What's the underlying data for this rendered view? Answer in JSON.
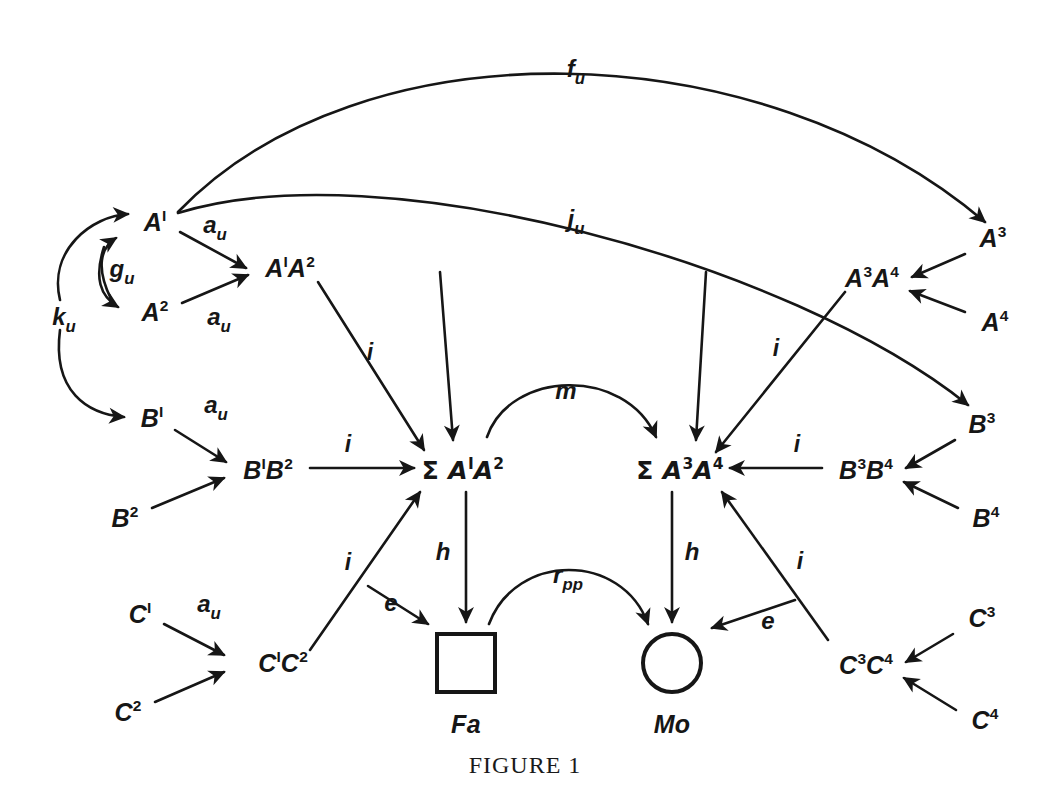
{
  "figure": {
    "caption": "FIGURE 1",
    "caption_top": 752,
    "background_color": "#ffffff",
    "ink_color": "#161616",
    "width": 1050,
    "height": 785
  },
  "nodes": [
    {
      "id": "A1",
      "html": "A<sup>I</sup>",
      "text": "A¹",
      "x": 155,
      "y": 222
    },
    {
      "id": "A2",
      "html": "A<sup>2</sup>",
      "text": "A²",
      "x": 155,
      "y": 312
    },
    {
      "id": "A1A2",
      "html": "A<sup>I</sup>A<sup>2</sup>",
      "text": "A¹A²",
      "x": 290,
      "y": 268
    },
    {
      "id": "B1",
      "html": "B<sup>I</sup>",
      "text": "B¹",
      "x": 152,
      "y": 418
    },
    {
      "id": "B2",
      "html": "B<sup>2</sup>",
      "text": "B²",
      "x": 125,
      "y": 518
    },
    {
      "id": "B1B2",
      "html": "B<sup>I</sup>B<sup>2</sup>",
      "text": "B¹B²",
      "x": 268,
      "y": 470
    },
    {
      "id": "C1",
      "html": "C<sup>I</sup>",
      "text": "C¹",
      "x": 140,
      "y": 614
    },
    {
      "id": "C2",
      "html": "C<sup>2</sup>",
      "text": "C²",
      "x": 128,
      "y": 712
    },
    {
      "id": "C1C2",
      "html": "C<sup>I</sup>C<sup>2</sup>",
      "text": "C¹C²",
      "x": 283,
      "y": 663
    },
    {
      "id": "SA1A2",
      "html": "<span class=\"sig\">Σ</span> A<sup>I</sup>A<sup>2</sup>",
      "text": "ΣA¹A²",
      "x": 463,
      "y": 470
    },
    {
      "id": "SA3A4",
      "html": "<span class=\"sig\">Σ</span> A<sup>3</sup>A<sup>4</sup>",
      "text": "ΣA³A⁴",
      "x": 680,
      "y": 470
    },
    {
      "id": "A3",
      "html": "A<sup>3</sup>",
      "text": "A³",
      "x": 993,
      "y": 238
    },
    {
      "id": "A3A4",
      "html": "A<sup>3</sup>A<sup>4</sup>",
      "text": "A³A⁴",
      "x": 872,
      "y": 278
    },
    {
      "id": "A4",
      "html": "A<sup>4</sup>",
      "text": "A⁴",
      "x": 995,
      "y": 322
    },
    {
      "id": "B3",
      "html": "B<sup>3</sup>",
      "text": "B³",
      "x": 982,
      "y": 424
    },
    {
      "id": "B3B4",
      "html": "B<sup>3</sup>B<sup>4</sup>",
      "text": "B³B⁴",
      "x": 866,
      "y": 470
    },
    {
      "id": "B4",
      "html": "B<sup>4</sup>",
      "text": "B⁴",
      "x": 986,
      "y": 518
    },
    {
      "id": "C3",
      "html": "C<sup>3</sup>",
      "text": "C³",
      "x": 982,
      "y": 618
    },
    {
      "id": "C3C4",
      "html": "C<sup>3</sup>C<sup>4</sup>",
      "text": "C³C⁴",
      "x": 866,
      "y": 665
    },
    {
      "id": "C4",
      "html": "C<sup>4</sup>",
      "text": "C⁴",
      "x": 985,
      "y": 720
    }
  ],
  "shapes": [
    {
      "id": "Fa",
      "kind": "square",
      "label": "Fa",
      "x": 466,
      "y": 663,
      "size": 62,
      "label_x": 466,
      "label_y": 724
    },
    {
      "id": "Mo",
      "kind": "circle",
      "label": "Mo",
      "x": 672,
      "y": 663,
      "size": 62,
      "label_x": 672,
      "label_y": 724
    }
  ],
  "edge_labels": [
    {
      "id": "fu",
      "html": "f<sub>u</sub>",
      "text": "f_u",
      "x": 576,
      "y": 72,
      "cls": ""
    },
    {
      "id": "ju",
      "html": "j<sub>u</sub>",
      "text": "j_u",
      "x": 576,
      "y": 222,
      "cls": ""
    },
    {
      "id": "au1",
      "html": "a<sub>u</sub>",
      "text": "a_u",
      "x": 215,
      "y": 228,
      "cls": ""
    },
    {
      "id": "gu",
      "html": "g<sub>u</sub>",
      "text": "g_u",
      "x": 122,
      "y": 272,
      "cls": ""
    },
    {
      "id": "ku",
      "html": "k<sub>u</sub>",
      "text": "k_u",
      "x": 64,
      "y": 320,
      "cls": ""
    },
    {
      "id": "au2",
      "html": "a<sub>u</sub>",
      "text": "a_u",
      "x": 219,
      "y": 320,
      "cls": ""
    },
    {
      "id": "au3",
      "html": "a<sub>u</sub>",
      "text": "a_u",
      "x": 216,
      "y": 408,
      "cls": ""
    },
    {
      "id": "au4",
      "html": "a<sub>u</sub>",
      "text": "a_u",
      "x": 209,
      "y": 607,
      "cls": ""
    },
    {
      "id": "i1",
      "html": "i",
      "text": "i",
      "x": 370,
      "y": 352,
      "cls": "small-i"
    },
    {
      "id": "i2",
      "html": "i",
      "text": "i",
      "x": 348,
      "y": 444,
      "cls": "small-i"
    },
    {
      "id": "i3",
      "html": "i",
      "text": "i",
      "x": 348,
      "y": 562,
      "cls": "small-i"
    },
    {
      "id": "i4",
      "html": "i",
      "text": "i",
      "x": 776,
      "y": 348,
      "cls": "small-i"
    },
    {
      "id": "i5",
      "html": "i",
      "text": "i",
      "x": 797,
      "y": 444,
      "cls": "small-i"
    },
    {
      "id": "i6",
      "html": "i",
      "text": "i",
      "x": 800,
      "y": 561,
      "cls": "small-i"
    },
    {
      "id": "m",
      "html": "m",
      "text": "m",
      "x": 566,
      "y": 391,
      "cls": ""
    },
    {
      "id": "h1",
      "html": "h",
      "text": "h",
      "x": 443,
      "y": 552,
      "cls": ""
    },
    {
      "id": "h2",
      "html": "h",
      "text": "h",
      "x": 692,
      "y": 552,
      "cls": ""
    },
    {
      "id": "e1",
      "html": "e",
      "text": "e",
      "x": 391,
      "y": 603,
      "cls": ""
    },
    {
      "id": "e2",
      "html": "e",
      "text": "e",
      "x": 768,
      "y": 621,
      "cls": ""
    },
    {
      "id": "rpp",
      "html": "r<sub>pp</sub>",
      "text": "r_pp",
      "x": 568,
      "y": 578,
      "cls": ""
    }
  ],
  "edges": [
    {
      "id": "fu-curve",
      "from": "A1",
      "to": "A3",
      "label": "fu",
      "kind": "curve",
      "d": "M 178 212 C 360 22 760 30 985 222",
      "arrow": true
    },
    {
      "id": "ju-curve",
      "from": "A1",
      "to": "B3",
      "label": "ju",
      "kind": "curve",
      "d": "M 178 213 C 380 150 790 262 968 405",
      "arrow": true
    },
    {
      "id": "ku-to-A1",
      "from": "ku-hub",
      "to": "A1",
      "label": "ku",
      "kind": "curve",
      "d": "M 60 300 C 48 250 92 216 128 214",
      "arrow": true
    },
    {
      "id": "ku-to-B1",
      "from": "ku-hub",
      "to": "B1",
      "label": "ku",
      "kind": "curve",
      "d": "M 60 330 C 52 392 88 414 124 417",
      "arrow": true
    },
    {
      "id": "gu-up",
      "from": "A2",
      "to": "A1",
      "label": "gu",
      "kind": "curve",
      "d": "M 111 299 C 96 268 100 248 116 238",
      "arrow": true
    },
    {
      "id": "gu-down",
      "from": "A1",
      "to": "A2",
      "label": "gu",
      "kind": "curve",
      "d": "M 104 247 C 94 278 100 296 118 307",
      "arrow": true
    },
    {
      "id": "A1-to-A1A2",
      "from": "A1",
      "to": "A1A2",
      "label": "au1",
      "kind": "line",
      "d": "M 180 232 L 246 268",
      "arrow": true
    },
    {
      "id": "A2-to-A1A2",
      "from": "A2",
      "to": "A1A2",
      "label": "au2",
      "kind": "line",
      "d": "M 182 303 L 248 275",
      "arrow": true
    },
    {
      "id": "B1-to-B1B2",
      "from": "B1",
      "to": "B1B2",
      "label": "au3",
      "kind": "line",
      "d": "M 175 430 L 226 462",
      "arrow": true
    },
    {
      "id": "B2-to-B1B2",
      "from": "B2",
      "to": "B1B2",
      "label": "",
      "kind": "line",
      "d": "M 152 508 L 224 478",
      "arrow": true
    },
    {
      "id": "C1-to-C1C2",
      "from": "C1",
      "to": "C1C2",
      "label": "au4",
      "kind": "line",
      "d": "M 164 624 L 224 655",
      "arrow": true
    },
    {
      "id": "C2-to-C1C2",
      "from": "C2",
      "to": "C1C2",
      "label": "",
      "kind": "line",
      "d": "M 155 702 L 224 672",
      "arrow": true
    },
    {
      "id": "A1A2-to-S12",
      "from": "A1A2",
      "to": "SA1A2",
      "label": "i1",
      "kind": "line",
      "d": "M 318 282 L 424 450",
      "arrow": true
    },
    {
      "id": "B1B2-to-S12",
      "from": "B1B2",
      "to": "SA1A2",
      "label": "i2",
      "kind": "line",
      "d": "M 310 468 L 414 468",
      "arrow": true
    },
    {
      "id": "C1C2-to-S12",
      "from": "C1C2",
      "to": "SA1A2",
      "label": "i3",
      "kind": "line",
      "d": "M 310 650 L 420 492",
      "arrow": true
    },
    {
      "id": "A3A4-to-S34",
      "from": "A3A4",
      "to": "SA3A4",
      "label": "i4",
      "kind": "line",
      "d": "M 845 292 L 716 452",
      "arrow": true
    },
    {
      "id": "B3B4-to-S34",
      "from": "B3B4",
      "to": "SA3A4",
      "label": "i5",
      "kind": "line",
      "d": "M 822 468 L 730 468",
      "arrow": true
    },
    {
      "id": "C3C4-to-S34",
      "from": "C3C4",
      "to": "SA3A4",
      "label": "i6",
      "kind": "line",
      "d": "M 828 640 L 722 492",
      "arrow": true
    },
    {
      "id": "top-into-S12",
      "from": "above",
      "to": "SA1A2",
      "label": "",
      "kind": "line",
      "d": "M 440 272 L 453 440",
      "arrow": true
    },
    {
      "id": "top-into-S34",
      "from": "above",
      "to": "SA3A4",
      "label": "",
      "kind": "line",
      "d": "M 706 272 L 696 440",
      "arrow": true
    },
    {
      "id": "m-arc",
      "from": "SA1A2",
      "to": "SA3A4",
      "label": "m",
      "kind": "curve",
      "d": "M 487 437 C 510 370 625 366 656 437",
      "arrow": true
    },
    {
      "id": "h-left",
      "from": "SA1A2",
      "to": "Fa",
      "label": "h1",
      "kind": "line",
      "d": "M 466 492 L 466 622",
      "arrow": true
    },
    {
      "id": "h-right",
      "from": "SA3A4",
      "to": "Mo",
      "label": "h2",
      "kind": "line",
      "d": "M 672 492 L 672 622",
      "arrow": true
    },
    {
      "id": "e-left",
      "from": "C1C2",
      "to": "Fa",
      "label": "e1",
      "kind": "line",
      "d": "M 368 586 L 428 624",
      "arrow": true
    },
    {
      "id": "e-right",
      "from": "C3C4",
      "to": "Mo",
      "label": "e2",
      "kind": "line",
      "d": "M 795 600 L 712 628",
      "arrow": true
    },
    {
      "id": "rpp-arc",
      "from": "Fa",
      "to": "Mo",
      "label": "rpp",
      "kind": "curve",
      "d": "M 489 624 C 516 552 622 552 648 624",
      "arrow": true
    },
    {
      "id": "A3-to-A3A4",
      "from": "A3",
      "to": "A3A4",
      "label": "",
      "kind": "line",
      "d": "M 965 254 L 912 277",
      "arrow": true
    },
    {
      "id": "A4-to-A3A4",
      "from": "A4",
      "to": "A3A4",
      "label": "",
      "kind": "line",
      "d": "M 965 312 L 910 291",
      "arrow": true
    },
    {
      "id": "B3-to-B3B4",
      "from": "B3",
      "to": "B3B4",
      "label": "",
      "kind": "line",
      "d": "M 955 440 L 906 468",
      "arrow": true
    },
    {
      "id": "B4-to-B3B4",
      "from": "B4",
      "to": "B3B4",
      "label": "",
      "kind": "line",
      "d": "M 958 508 L 904 482",
      "arrow": true
    },
    {
      "id": "C3-to-C3C4",
      "from": "C3",
      "to": "C3C4",
      "label": "",
      "kind": "line",
      "d": "M 953 634 L 906 662",
      "arrow": true
    },
    {
      "id": "C4-to-C3C4",
      "from": "C4",
      "to": "C3C4",
      "label": "",
      "kind": "line",
      "d": "M 956 710 L 904 678",
      "arrow": true
    }
  ]
}
